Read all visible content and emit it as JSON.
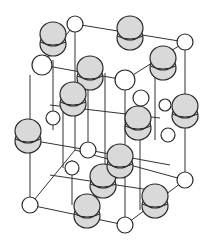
{
  "diagram": {
    "title": "",
    "type": "crystal-lattice-unit-cell",
    "colors": {
      "line": "#333333",
      "small_atom_fill": "#ffffff",
      "large_atom_fill": "#d9d9d9",
      "stroke": "#2a2a2a"
    },
    "bonds": [
      [
        42,
        65,
        75,
        24
      ],
      [
        75,
        24,
        185,
        42
      ],
      [
        42,
        65,
        125,
        80
      ],
      [
        125,
        80,
        185,
        42
      ],
      [
        30,
        75,
        30,
        205
      ],
      [
        125,
        80,
        125,
        225
      ],
      [
        185,
        42,
        185,
        180
      ],
      [
        75,
        24,
        75,
        150
      ],
      [
        30,
        205,
        125,
        225
      ],
      [
        125,
        225,
        185,
        180
      ],
      [
        30,
        205,
        75,
        150
      ],
      [
        75,
        150,
        185,
        180
      ],
      [
        50,
        105,
        160,
        118
      ],
      [
        50,
        175,
        150,
        190
      ],
      [
        53,
        60,
        53,
        130
      ],
      [
        155,
        50,
        155,
        140
      ],
      [
        30,
        140,
        88,
        150
      ],
      [
        88,
        150,
        170,
        165
      ],
      [
        63,
        92,
        63,
        168
      ],
      [
        105,
        73,
        105,
        195
      ],
      [
        88,
        150,
        88,
        75
      ],
      [
        140,
        100,
        140,
        210
      ],
      [
        72,
        205,
        72,
        160
      ]
    ],
    "small_atoms": [
      {
        "x": 42,
        "y": 65,
        "r": 10
      },
      {
        "x": 75,
        "y": 24,
        "r": 8
      },
      {
        "x": 185,
        "y": 42,
        "r": 8
      },
      {
        "x": 125,
        "y": 80,
        "r": 10
      },
      {
        "x": 88,
        "y": 150,
        "r": 8
      },
      {
        "x": 53,
        "y": 118,
        "r": 7
      },
      {
        "x": 30,
        "y": 205,
        "r": 8
      },
      {
        "x": 125,
        "y": 225,
        "r": 8
      },
      {
        "x": 185,
        "y": 180,
        "r": 8
      },
      {
        "x": 168,
        "y": 135,
        "r": 7
      },
      {
        "x": 141,
        "y": 98,
        "r": 8
      },
      {
        "x": 72,
        "y": 168,
        "r": 7
      },
      {
        "x": 165,
        "y": 105,
        "r": 6
      }
    ],
    "large_atoms": [
      {
        "x": 53,
        "y": 38,
        "rx": 13,
        "ry": 12
      },
      {
        "x": 130,
        "y": 32,
        "rx": 13,
        "ry": 12
      },
      {
        "x": 90,
        "y": 72,
        "rx": 13,
        "ry": 12
      },
      {
        "x": 163,
        "y": 62,
        "rx": 13,
        "ry": 12
      },
      {
        "x": 73,
        "y": 98,
        "rx": 13,
        "ry": 12
      },
      {
        "x": 185,
        "y": 110,
        "rx": 13,
        "ry": 12
      },
      {
        "x": 28,
        "y": 135,
        "rx": 13,
        "ry": 12
      },
      {
        "x": 138,
        "y": 122,
        "rx": 13,
        "ry": 12
      },
      {
        "x": 103,
        "y": 180,
        "rx": 13,
        "ry": 12
      },
      {
        "x": 120,
        "y": 160,
        "rx": 13,
        "ry": 12
      },
      {
        "x": 155,
        "y": 200,
        "rx": 13,
        "ry": 12
      },
      {
        "x": 87,
        "y": 210,
        "rx": 13,
        "ry": 12
      }
    ]
  }
}
